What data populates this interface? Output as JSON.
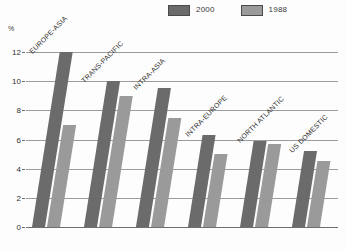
{
  "chart_data": {
    "type": "bar",
    "title": "",
    "subtitle": "",
    "xlabel": "",
    "ylabel": "%",
    "ylim": [
      0,
      12
    ],
    "yticks": [
      0,
      2,
      4,
      6,
      8,
      10,
      12
    ],
    "grid": true,
    "legend_position": "top-right",
    "categories": [
      "EUROPE-ASIA",
      "TRANS-PACIFIC",
      "INTRA-ASIA",
      "INTRA-EUROPE",
      "NORTH ATLANTIC",
      "US DOMESTIC"
    ],
    "series": [
      {
        "name": "2000",
        "color": "#6b6b6b",
        "values": [
          12.0,
          10.0,
          9.5,
          6.3,
          5.9,
          5.2
        ]
      },
      {
        "name": "1988",
        "color": "#9a9a9a",
        "values": [
          7.0,
          9.0,
          7.5,
          5.0,
          5.7,
          4.5
        ]
      }
    ]
  },
  "axis": {
    "unit_label": "%",
    "tick_labels": [
      "12",
      "10",
      "8",
      "6",
      "4",
      "2",
      "0"
    ]
  },
  "legend": {
    "entries": [
      {
        "label": "2000",
        "color": "#6b6b6b"
      },
      {
        "label": "1988",
        "color": "#9a9a9a"
      }
    ]
  }
}
